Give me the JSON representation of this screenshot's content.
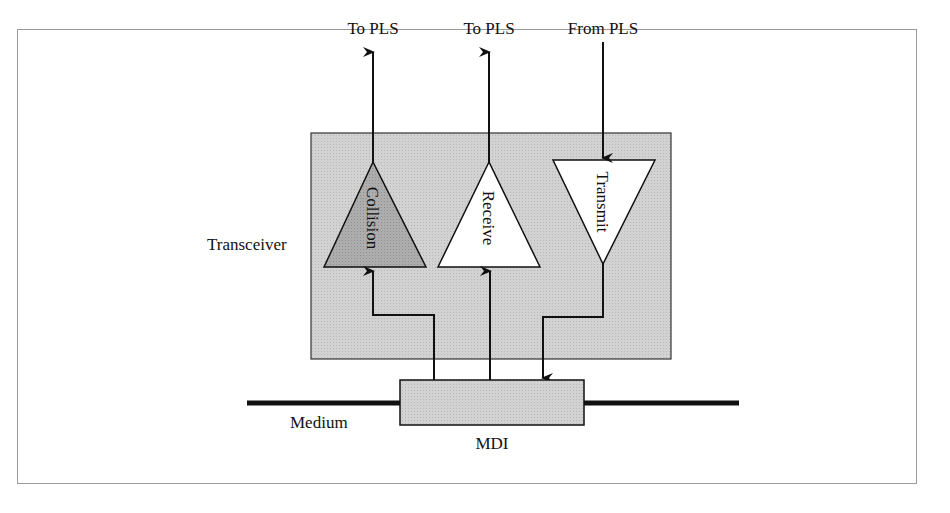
{
  "diagram": {
    "labels": {
      "to_pls_1": "To PLS",
      "to_pls_2": "To PLS",
      "from_pls": "From PLS",
      "transceiver": "Transceiver",
      "medium": "Medium",
      "mdi": "MDI"
    },
    "blocks": {
      "collision": "Collision",
      "receive": "Receive",
      "transmit": "Transmit"
    },
    "colors": {
      "transceiver_fill": "#cfcfcf",
      "collision_fill": "#a9a9a9",
      "mdi_fill": "#d6d6d6",
      "line": "#111111",
      "frame_border": "#9a9a9a"
    }
  }
}
